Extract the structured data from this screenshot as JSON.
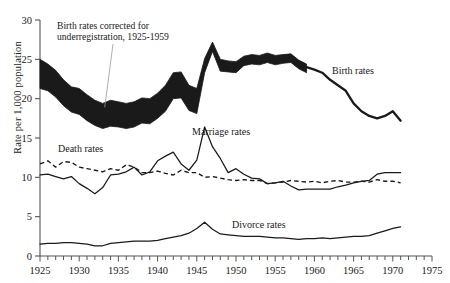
{
  "figure": {
    "cut_off_title": "",
    "ylabel": "Rate per 1,000 population"
  },
  "annotation": {
    "line1": "Birth rates corrected for",
    "line2": "underregistration, 1925-1959"
  },
  "labels": {
    "birth": "Birth rates",
    "marriage": "Marriage rates",
    "death": "Death rates",
    "divorce": "Divorce rates"
  },
  "colors": {
    "ink": "#1a1a1a",
    "axis": "#555555",
    "leader": "#9a9a9a"
  },
  "chart_data": {
    "type": "line",
    "title": "",
    "xlabel": "",
    "ylabel": "Rate per 1,000 population",
    "xlim": [
      1925,
      1975
    ],
    "ylim": [
      0,
      30
    ],
    "xticks": [
      1925,
      1930,
      1935,
      1940,
      1945,
      1950,
      1955,
      1960,
      1965,
      1970,
      1975
    ],
    "xtick_labels": [
      "1925",
      "1930",
      "1935",
      "1940",
      "1945",
      "1950",
      "1955",
      "1960",
      "1965",
      "1970",
      "1975"
    ],
    "xminor_tick_step": 1,
    "yticks": [
      0,
      5,
      10,
      15,
      20,
      25,
      30
    ],
    "ytick_labels": [
      "0",
      "5",
      "10",
      "15",
      "20",
      "25",
      "30"
    ],
    "grid": false,
    "legend": "inline-labels",
    "x": [
      1925,
      1926,
      1927,
      1928,
      1929,
      1930,
      1931,
      1932,
      1933,
      1934,
      1935,
      1936,
      1937,
      1938,
      1939,
      1940,
      1941,
      1942,
      1943,
      1944,
      1945,
      1946,
      1947,
      1948,
      1949,
      1950,
      1951,
      1952,
      1953,
      1954,
      1955,
      1956,
      1957,
      1958,
      1959,
      1960,
      1961,
      1962,
      1963,
      1964,
      1965,
      1966,
      1967,
      1968,
      1969,
      1970,
      1971
    ],
    "series": [
      {
        "name": "Birth rates",
        "style": "band-then-line",
        "band_years": [
          1925,
          1959
        ],
        "note": "1925-1959 plotted as a thick band = range between registered and corrected-for-underregistration rates",
        "values": [
          23.0,
          22.4,
          21.6,
          20.5,
          19.7,
          19.5,
          18.7,
          18.0,
          17.6,
          18.0,
          17.8,
          17.6,
          17.8,
          18.3,
          18.2,
          18.9,
          19.9,
          21.5,
          21.6,
          19.9,
          19.5,
          23.3,
          26.6,
          24.2,
          24.1,
          24.1,
          24.9,
          25.1,
          25.0,
          25.3,
          25.0,
          25.2,
          25.3,
          24.5,
          24.0,
          23.7,
          23.3,
          22.4,
          21.7,
          21.0,
          19.4,
          18.4,
          17.8,
          17.5,
          17.8,
          18.4,
          17.2
        ],
        "band_upper": [
          25.0,
          24.4,
          23.6,
          22.4,
          21.5,
          21.3,
          20.5,
          19.8,
          19.4,
          19.8,
          19.6,
          19.4,
          19.6,
          20.1,
          20.0,
          20.7,
          21.7,
          23.3,
          23.4,
          21.7,
          21.3,
          25.1,
          27.2,
          25.0,
          24.8,
          24.7,
          25.4,
          25.6,
          25.5,
          25.8,
          25.5,
          25.6,
          25.7,
          24.9,
          24.4
        ],
        "band_lower": [
          21.3,
          21.0,
          20.2,
          19.1,
          18.3,
          18.0,
          17.2,
          16.6,
          16.2,
          16.5,
          16.4,
          16.2,
          16.4,
          16.9,
          16.8,
          17.5,
          18.4,
          20.0,
          20.1,
          18.5,
          18.1,
          23.3,
          26.0,
          23.5,
          23.4,
          23.3,
          24.2,
          24.4,
          24.3,
          24.6,
          24.3,
          24.5,
          24.6,
          23.8,
          23.3
        ]
      },
      {
        "name": "Marriage rates",
        "style": "solid",
        "values": [
          10.3,
          10.4,
          10.1,
          9.8,
          10.1,
          9.2,
          8.6,
          7.9,
          8.7,
          10.3,
          10.4,
          10.7,
          11.3,
          10.3,
          10.7,
          12.1,
          12.7,
          13.2,
          11.7,
          10.9,
          12.2,
          16.4,
          13.9,
          12.4,
          10.6,
          11.1,
          10.4,
          9.9,
          9.8,
          9.2,
          9.3,
          9.5,
          8.9,
          8.4,
          8.5,
          8.5,
          8.5,
          8.5,
          8.8,
          9.0,
          9.3,
          9.5,
          9.6,
          10.4,
          10.6,
          10.6,
          10.6
        ]
      },
      {
        "name": "Death rates",
        "style": "dashed",
        "values": [
          11.7,
          12.1,
          11.3,
          12.0,
          11.9,
          11.3,
          11.1,
          10.9,
          10.7,
          11.1,
          10.9,
          11.6,
          11.3,
          10.6,
          10.6,
          10.8,
          10.5,
          10.3,
          10.9,
          10.6,
          10.6,
          10.0,
          10.1,
          9.9,
          9.7,
          9.6,
          9.7,
          9.6,
          9.6,
          9.2,
          9.3,
          9.4,
          9.6,
          9.5,
          9.4,
          9.5,
          9.3,
          9.5,
          9.6,
          9.4,
          9.4,
          9.5,
          9.4,
          9.7,
          9.5,
          9.5,
          9.3
        ]
      },
      {
        "name": "Divorce rates",
        "style": "solid",
        "values": [
          1.5,
          1.6,
          1.6,
          1.7,
          1.7,
          1.6,
          1.5,
          1.3,
          1.3,
          1.6,
          1.7,
          1.8,
          1.9,
          1.9,
          1.9,
          2.0,
          2.2,
          2.4,
          2.6,
          2.9,
          3.5,
          4.3,
          3.4,
          2.8,
          2.7,
          2.6,
          2.5,
          2.5,
          2.5,
          2.4,
          2.3,
          2.3,
          2.2,
          2.1,
          2.2,
          2.2,
          2.3,
          2.2,
          2.3,
          2.4,
          2.5,
          2.5,
          2.6,
          2.9,
          3.2,
          3.5,
          3.7
        ]
      }
    ],
    "annotations": [
      {
        "text": "Birth rates corrected for underregistration, 1925-1959",
        "points_to_year": 1933,
        "points_to_value": 19.4
      }
    ]
  }
}
